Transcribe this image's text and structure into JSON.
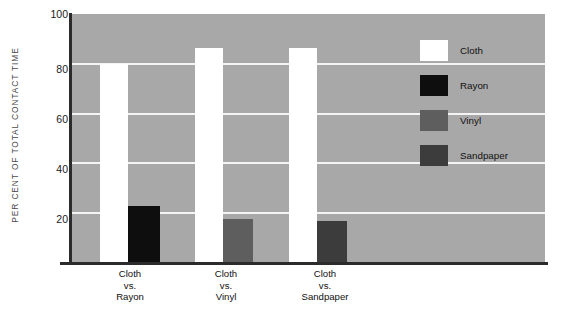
{
  "chart_data": {
    "type": "bar",
    "title": "",
    "xlabel": "",
    "ylabel": "PER CENT OF TOTAL CONTACT TIME",
    "ylim": [
      0,
      100
    ],
    "yticks": [
      100,
      80,
      60,
      40,
      20
    ],
    "ytick_labels": [
      "100",
      "80",
      "60",
      "40",
      "20"
    ],
    "grid": true,
    "legend_position": "right",
    "categories": [
      "Cloth vs. Rayon",
      "Cloth vs. Vinyl",
      "Cloth vs. Sandpaper"
    ],
    "category_lines": [
      [
        "Cloth",
        "vs.",
        "Rayon"
      ],
      [
        "Cloth",
        "vs.",
        "Vinyl"
      ],
      [
        "Cloth",
        "vs.",
        "Sandpaper"
      ]
    ],
    "series": [
      {
        "name": "Cloth",
        "color": "#ffffff",
        "values": [
          80,
          86.5,
          86.5
        ]
      },
      {
        "name": "Rayon",
        "color": "#0e0e0e",
        "values": [
          23,
          null,
          null
        ]
      },
      {
        "name": "Vinyl",
        "color": "#5e5e5e",
        "values": [
          null,
          17.5,
          null
        ]
      },
      {
        "name": "Sandpaper",
        "color": "#3c3c3c",
        "values": [
          null,
          null,
          17
        ]
      }
    ],
    "bars": [
      {
        "group": 0,
        "series": "Cloth",
        "value": 80,
        "x": 28,
        "width": 28,
        "color": "#ffffff"
      },
      {
        "group": 0,
        "series": "Rayon",
        "value": 23,
        "x": 56,
        "width": 32,
        "color": "#0e0e0e"
      },
      {
        "group": 1,
        "series": "Cloth",
        "value": 86.5,
        "x": 123,
        "width": 28,
        "color": "#ffffff"
      },
      {
        "group": 1,
        "series": "Vinyl",
        "value": 17.5,
        "x": 151,
        "width": 30,
        "color": "#5e5e5e"
      },
      {
        "group": 2,
        "series": "Cloth",
        "value": 86.5,
        "x": 217,
        "width": 28,
        "color": "#ffffff"
      },
      {
        "group": 2,
        "series": "Sandpaper",
        "value": 17,
        "x": 245,
        "width": 30,
        "color": "#3c3c3c"
      }
    ],
    "plot_background": "#a8a8a8",
    "gridline_color": "#f4f4f4",
    "axis_color": "#2b2b2b"
  },
  "legend": {
    "items": [
      {
        "label": "Cloth",
        "color": "#ffffff"
      },
      {
        "label": "Rayon",
        "color": "#0e0e0e"
      },
      {
        "label": "Vinyl",
        "color": "#5e5e5e"
      },
      {
        "label": "Sandpaper",
        "color": "#3c3c3c"
      }
    ]
  },
  "axis": {
    "y_title": "PER CENT OF TOTAL CONTACT TIME",
    "y_tick_100": "100",
    "y_tick_80": "80",
    "y_tick_60": "60",
    "y_tick_40": "40",
    "y_tick_20": "20"
  },
  "x_labels": {
    "g0_l0": "Cloth",
    "g0_l1": "vs.",
    "g0_l2": "Rayon",
    "g1_l0": "Cloth",
    "g1_l1": "vs.",
    "g1_l2": "Vinyl",
    "g2_l0": "Cloth",
    "g2_l1": "vs.",
    "g2_l2": "Sandpaper"
  }
}
